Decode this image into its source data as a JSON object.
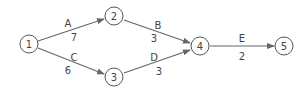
{
  "diagram": {
    "type": "activity-network",
    "nodes": [
      {
        "id": "1",
        "label": "1",
        "x": 29,
        "y": 44
      },
      {
        "id": "2",
        "label": "2",
        "x": 114,
        "y": 16
      },
      {
        "id": "3",
        "label": "3",
        "x": 114,
        "y": 77
      },
      {
        "id": "4",
        "label": "4",
        "x": 200,
        "y": 46
      },
      {
        "id": "5",
        "label": "5",
        "x": 284,
        "y": 46
      }
    ],
    "edges": [
      {
        "from": "1",
        "to": "2",
        "activity": "A",
        "duration": "7"
      },
      {
        "from": "1",
        "to": "3",
        "activity": "C",
        "duration": "6"
      },
      {
        "from": "2",
        "to": "4",
        "activity": "B",
        "duration": "3"
      },
      {
        "from": "3",
        "to": "4",
        "activity": "D",
        "duration": "3"
      },
      {
        "from": "4",
        "to": "5",
        "activity": "E",
        "duration": "2"
      }
    ]
  }
}
